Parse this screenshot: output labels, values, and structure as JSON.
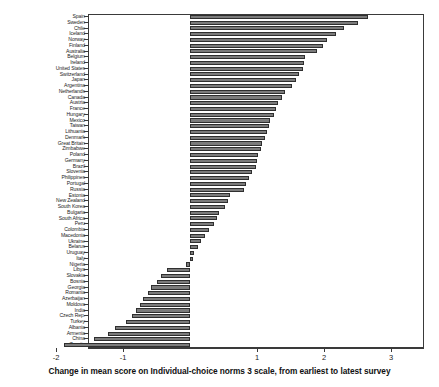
{
  "chart": {
    "type": "bar",
    "orientation": "horizontal",
    "title": "",
    "xlabel": "Change in mean score on Individual-choice norms 3 scale, from earliest to latest survey",
    "ylabel": "",
    "xlim": [
      -2.3,
      3.0
    ],
    "xticks": [
      -2,
      -1,
      1,
      2,
      3
    ],
    "xtick_labels": [
      "-2",
      "-1",
      "1",
      "2",
      "3"
    ],
    "zero_line": 0,
    "grid": false,
    "legend": false,
    "bar_color": "#7b7b7b",
    "bar_edge_color": "#2f2f2f",
    "frame_color": "#3a3a3a",
    "background": "#ffffff"
  },
  "chart_data": {
    "type": "bar",
    "title": "",
    "xlabel": "Change in mean score on Individual-choice norms 3 scale, from earliest to latest survey",
    "ylabel": "",
    "xlim": [
      -2.3,
      3.0
    ],
    "xticks": [
      -2,
      -1,
      1,
      2,
      3
    ],
    "grid": false,
    "legend_position": "none",
    "categories": [
      "Spain",
      "Sweden",
      "Chile",
      "Iceland",
      "Norway",
      "Finland",
      "Australia",
      "Belgium",
      "Ireland",
      "United States",
      "Switzerland",
      "Japan",
      "Argentina",
      "Netherlands",
      "Canada",
      "Austria",
      "France",
      "Hungary",
      "Mexico",
      "Taiwan",
      "Lithuania",
      "Denmark",
      "Great Britain",
      "Zimbabwe",
      "Poland",
      "Germany",
      "Brazil",
      "Slovenia",
      "Philippines",
      "Portugal",
      "Russia",
      "Estonia",
      "New Zealand",
      "South Korea",
      "Bulgaria",
      "South Africa",
      "Peru",
      "Colombia",
      "Macedonia",
      "Ukraine",
      "Belarus",
      "Uruguay",
      "Italy",
      "Nigeria",
      "Libya",
      "Slovakia",
      "Bosnia",
      "Georgia",
      "Romania",
      "Azerbaijan",
      "Moldova",
      "India",
      "Czech Rep.",
      "Turkey",
      "Albania",
      "Armenia",
      "China",
      "Croatia"
    ],
    "values": [
      2.65,
      2.5,
      2.3,
      2.18,
      2.05,
      1.98,
      1.9,
      1.72,
      1.7,
      1.68,
      1.62,
      1.58,
      1.52,
      1.42,
      1.38,
      1.32,
      1.28,
      1.25,
      1.2,
      1.18,
      1.15,
      1.12,
      1.08,
      1.06,
      1.02,
      1.0,
      0.98,
      0.92,
      0.88,
      0.84,
      0.8,
      0.6,
      0.56,
      0.52,
      0.44,
      0.4,
      0.36,
      0.28,
      0.22,
      0.16,
      0.12,
      0.06,
      0.04,
      -0.06,
      -0.34,
      -0.44,
      -0.5,
      -0.58,
      -0.62,
      -0.7,
      -0.74,
      -0.8,
      -0.86,
      -0.96,
      -1.12,
      -1.22,
      -1.44,
      -1.88
    ]
  }
}
